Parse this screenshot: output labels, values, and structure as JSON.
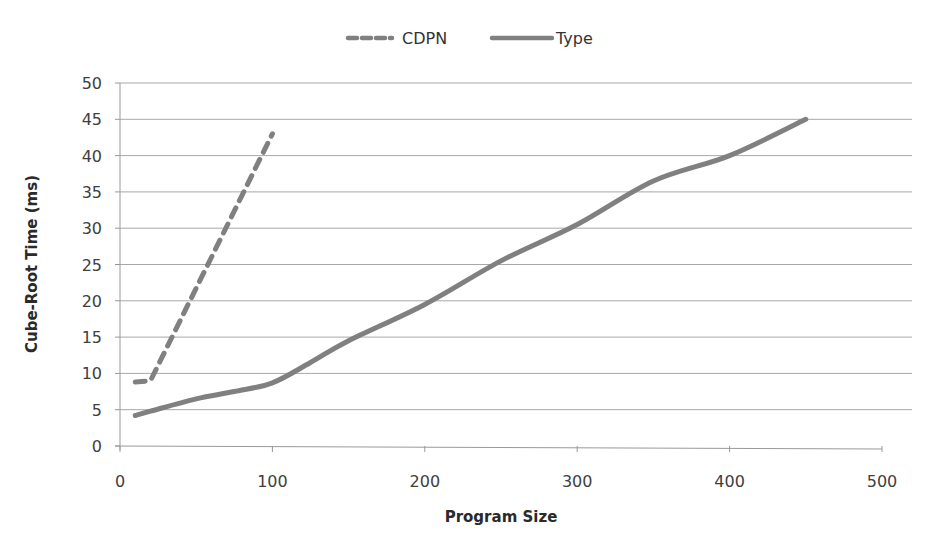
{
  "chart_data": {
    "type": "line",
    "title": "",
    "xlabel": "Program Size",
    "ylabel": "Cube-Root Time (ms)",
    "xlim": [
      0,
      500
    ],
    "ylim": [
      0,
      50
    ],
    "x_ticks": [
      0,
      100,
      200,
      300,
      400,
      500
    ],
    "y_ticks": [
      0,
      5,
      10,
      15,
      20,
      25,
      30,
      35,
      40,
      45,
      50
    ],
    "grid": {
      "horizontal": true,
      "vertical": false
    },
    "legend_position": "top",
    "series": [
      {
        "name": "CDPN",
        "style": "dashed",
        "color": "#808080",
        "x": [
          10,
          20,
          40,
          60,
          80,
          100
        ],
        "y": [
          8.8,
          9.0,
          17.5,
          26,
          34.5,
          43
        ]
      },
      {
        "name": "Type",
        "style": "solid",
        "color": "#808080",
        "x": [
          10,
          20,
          50,
          75,
          100,
          125,
          150,
          200,
          250,
          300,
          350,
          400,
          450
        ],
        "y": [
          4.2,
          4.8,
          6.5,
          7.5,
          8.7,
          11.5,
          14.5,
          19.5,
          25.5,
          30.5,
          36.5,
          40,
          45
        ]
      }
    ]
  },
  "legend": {
    "items": [
      {
        "label": "CDPN",
        "style": "dashed"
      },
      {
        "label": "Type",
        "style": "solid"
      }
    ]
  },
  "axes": {
    "x_title": "Program Size",
    "y_title": "Cube-Root Time (ms)",
    "x_tick_labels": [
      "0",
      "100",
      "200",
      "300",
      "400",
      "500"
    ],
    "y_tick_labels": [
      "0",
      "5",
      "10",
      "15",
      "20",
      "25",
      "30",
      "35",
      "40",
      "45",
      "50"
    ]
  }
}
